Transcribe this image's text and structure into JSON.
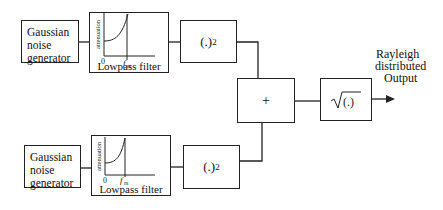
{
  "diagram": {
    "branches": [
      {
        "generator": {
          "line1": "Gaussian",
          "line2": "noise",
          "line3": "generator"
        },
        "filter": {
          "label": "Lowpass filter",
          "y_axis": "attenuation",
          "origin": "0",
          "cutoff": "fm"
        },
        "squarer": {
          "base": "(.)",
          "exp": "2"
        }
      },
      {
        "generator": {
          "line1": "Gaussian",
          "line2": "noise",
          "line3": "generator"
        },
        "filter": {
          "label": "Lowpass filter",
          "y_axis": "attenuation",
          "origin": "0",
          "cutoff": "fm"
        },
        "squarer": {
          "base": "(.)",
          "exp": "2"
        }
      }
    ],
    "adder": {
      "symbol": "+"
    },
    "sqrt": {
      "symbol": "√(.)",
      "inner": "(.)"
    },
    "output": {
      "line1": "Rayleigh",
      "line2": "distributed",
      "line3": "Output"
    }
  }
}
